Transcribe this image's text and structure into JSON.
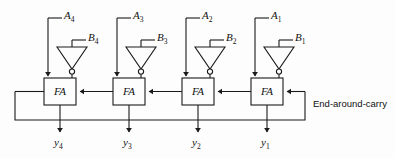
{
  "diagram": {
    "background_color": "#fdfdfd",
    "line_color": "#1a1a1a",
    "blocks": [
      {
        "id": "fa4",
        "label": "FA"
      },
      {
        "id": "fa3",
        "label": "FA"
      },
      {
        "id": "fa2",
        "label": "FA"
      },
      {
        "id": "fa1",
        "label": "FA"
      }
    ],
    "a_inputs": [
      {
        "name": "A",
        "sub": "4"
      },
      {
        "name": "A",
        "sub": "3"
      },
      {
        "name": "A",
        "sub": "2"
      },
      {
        "name": "A",
        "sub": "1"
      }
    ],
    "b_inputs": [
      {
        "name": "B",
        "sub": "4"
      },
      {
        "name": "B",
        "sub": "3"
      },
      {
        "name": "B",
        "sub": "2"
      },
      {
        "name": "B",
        "sub": "1"
      }
    ],
    "outputs": [
      {
        "name": "y",
        "sub": "4"
      },
      {
        "name": "y",
        "sub": "3"
      },
      {
        "name": "y",
        "sub": "2"
      },
      {
        "name": "y",
        "sub": "1"
      }
    ],
    "annotation": "End-around-carry",
    "gates": [
      {
        "type": "inverter",
        "bubble": true
      },
      {
        "type": "inverter",
        "bubble": true
      },
      {
        "type": "inverter",
        "bubble": true
      },
      {
        "type": "inverter",
        "bubble": true
      }
    ]
  }
}
